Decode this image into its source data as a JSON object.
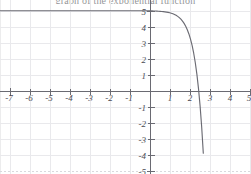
{
  "figure": {
    "title_partial": "graph of the exponential function",
    "width_px": 251,
    "height_px": 174,
    "background_color": "#ffffff",
    "grid_color": "#e9e9ec",
    "axis_color": "#6a6a72",
    "curve_color": "#6b6b73"
  },
  "chart_data": {
    "type": "line",
    "title": "",
    "xlabel": "",
    "ylabel": "",
    "xlim": [
      -7.5,
      5.1
    ],
    "ylim": [
      -5.6,
      5.4
    ],
    "grid": true,
    "legend": null,
    "x_ticks": [
      -7,
      -6,
      -5,
      -4,
      -3,
      -2,
      -1,
      1,
      2,
      3,
      4,
      5
    ],
    "x_tick_labels": [
      "-7",
      "-6",
      "-5",
      "-4",
      "-3",
      "-2",
      "-1",
      "1",
      "2",
      "3",
      "4",
      "5"
    ],
    "y_ticks": [
      5,
      4,
      3,
      2,
      1,
      -1,
      -2,
      -3,
      -4,
      -5
    ],
    "y_tick_labels": [
      "5",
      "4",
      "3",
      "2",
      "1",
      "-1",
      "-2",
      "-3",
      "-4",
      "-5"
    ],
    "series": [
      {
        "name": "decreasing exponential curve",
        "description": "Curve approaches y = 5 asymptotically as x decreases; passes through (0, 2); crosses x-axis near x = 1.1; falls steeply off the bottom of the frame near x = 2.85",
        "x": [
          -7.5,
          -7.0,
          -6.5,
          -6.0,
          -5.5,
          -5.0,
          -4.5,
          -4.0,
          -3.5,
          -3.0,
          -2.5,
          -2.0,
          -1.5,
          -1.0,
          -0.5,
          0.0,
          0.5,
          1.0,
          1.5,
          2.0,
          2.5,
          2.85
        ],
        "y": [
          5.05,
          5.02,
          4.98,
          4.93,
          4.87,
          4.79,
          4.68,
          4.54,
          4.36,
          4.12,
          3.81,
          3.4,
          2.87,
          2.17,
          1.25,
          2.0,
          0.74,
          -0.25,
          -1.35,
          -2.45,
          -3.85,
          -5.3
        ]
      }
    ],
    "key_points": [
      {
        "label": "y-intercept",
        "x": 0,
        "y": 2
      },
      {
        "label": "x-intercept",
        "x": 1.1,
        "y": 0
      },
      {
        "label": "left asymptote level",
        "x": -7.5,
        "y": 5
      }
    ]
  }
}
